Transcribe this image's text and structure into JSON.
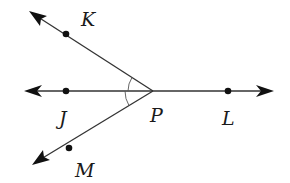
{
  "diagram": {
    "type": "geometry-angles",
    "vertex": {
      "name": "P",
      "x": 153,
      "y": 91
    },
    "line": {
      "name": "line JL",
      "from": {
        "x": 25,
        "y": 91
      },
      "to": {
        "x": 273,
        "y": 91
      },
      "arrows": [
        "left",
        "right"
      ]
    },
    "rays": [
      {
        "name": "ray PK",
        "from": "P",
        "to": {
          "x": 30,
          "y": 12
        },
        "arrow": true
      },
      {
        "name": "ray PM",
        "from": "P",
        "to": {
          "x": 33,
          "y": 164
        },
        "arrow": true
      }
    ],
    "points": [
      {
        "label": "K",
        "x": 66,
        "y": 34,
        "label_x": 83,
        "label_y": 26
      },
      {
        "label": "J",
        "x": 66,
        "y": 91,
        "label_x": 60,
        "label_y": 124
      },
      {
        "label": "P",
        "x": 153,
        "y": 91,
        "label_x": 150,
        "label_y": 122
      },
      {
        "label": "L",
        "x": 228,
        "y": 91,
        "label_x": 222,
        "label_y": 124
      },
      {
        "label": "M",
        "x": 69,
        "y": 148,
        "label_x": 76,
        "label_y": 176
      }
    ],
    "angle_marks": [
      {
        "between": [
          "K",
          "J"
        ],
        "vertex": "P",
        "arcs": 1
      },
      {
        "between": [
          "J",
          "M"
        ],
        "vertex": "P",
        "arcs": 1
      }
    ],
    "colors": {
      "line": "#333333",
      "point": "#111111",
      "label": "#1a1a1a",
      "background": "#ffffff"
    }
  },
  "labels": {
    "K": "K",
    "J": "J",
    "P": "P",
    "L": "L",
    "M": "M"
  }
}
